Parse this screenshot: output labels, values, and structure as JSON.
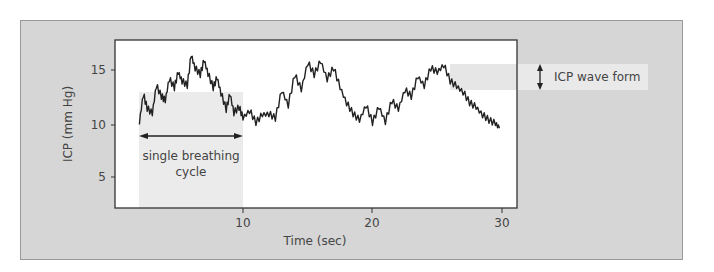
{
  "figure": {
    "ylabel": "ICP (mm Hg)",
    "xlabel": "Time (sec)",
    "annotations": {
      "breathing_cycle": [
        "single breathing",
        "cycle"
      ],
      "wave_form": "ICP wave form"
    },
    "colors": {
      "panel_bg": "#d6d6d6",
      "plot_bg": "#ffffff",
      "highlight_band": "#ebebeb",
      "trace": "#222222"
    }
  },
  "chart_data": {
    "type": "line",
    "title": "",
    "xlabel": "Time (sec)",
    "ylabel": "ICP (mm Hg)",
    "xlim": [
      0,
      30
    ],
    "ylim": [
      2,
      17
    ],
    "xticks": [
      10,
      20,
      30
    ],
    "yticks": [
      5,
      10,
      15
    ],
    "grid": false,
    "legend": null,
    "series": [
      {
        "name": "ICP",
        "x": [
          2.0,
          2.3,
          2.6,
          3.0,
          3.3,
          3.7,
          4.0,
          4.3,
          4.7,
          5.0,
          5.3,
          5.7,
          6.0,
          6.3,
          6.7,
          7.0,
          7.3,
          7.7,
          8.0,
          8.3,
          8.7,
          9.0,
          9.3,
          9.7,
          10.0,
          10.5,
          11.0,
          11.5,
          12.0,
          12.5,
          13.0,
          13.5,
          14.0,
          14.5,
          15.0,
          15.5,
          16.0,
          16.5,
          17.0,
          17.5,
          18.0,
          18.5,
          19.0,
          19.5,
          20.0,
          20.5,
          21.0,
          21.5,
          22.0,
          22.5,
          23.0,
          23.5,
          24.0,
          24.5,
          25.0,
          25.5,
          26.0,
          26.5,
          27.0,
          27.5,
          28.0,
          28.5,
          29.0,
          29.5,
          29.8
        ],
        "y": [
          10.2,
          12.8,
          11.5,
          11.0,
          13.6,
          12.6,
          12.2,
          14.2,
          13.4,
          14.8,
          14.0,
          13.6,
          16.4,
          15.2,
          14.6,
          15.9,
          14.7,
          13.4,
          14.3,
          12.9,
          11.4,
          12.8,
          11.1,
          11.6,
          10.6,
          11.3,
          10.2,
          10.9,
          11.0,
          10.6,
          13.1,
          11.8,
          14.6,
          13.2,
          15.7,
          14.6,
          15.8,
          14.2,
          15.2,
          13.4,
          12.0,
          11.0,
          10.4,
          11.8,
          10.2,
          11.6,
          10.3,
          12.2,
          11.4,
          13.2,
          12.6,
          14.4,
          13.6,
          15.2,
          14.8,
          15.5,
          14.0,
          13.5,
          13.0,
          12.0,
          11.6,
          10.9,
          10.4,
          10.1,
          9.7
        ]
      }
    ],
    "annotations": [
      {
        "text": "single breathing cycle",
        "x_range": [
          2,
          10
        ],
        "type": "double-arrow-horizontal"
      },
      {
        "text": "ICP wave form",
        "type": "double-arrow-vertical"
      }
    ]
  }
}
